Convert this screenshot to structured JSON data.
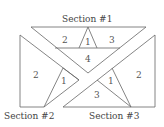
{
  "sections": [
    {
      "title": "Section #1",
      "pieces": [
        "2",
        "1",
        "3",
        "4"
      ]
    },
    {
      "title": "Section #2",
      "pieces": [
        "2",
        "1"
      ]
    },
    {
      "title": "Section #3",
      "pieces": [
        "1",
        "2",
        "3"
      ]
    }
  ]
}
